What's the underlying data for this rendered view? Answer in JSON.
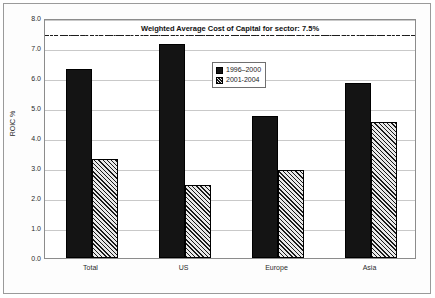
{
  "chart_data": {
    "type": "bar",
    "title": "",
    "annotation": "Weighted Average Cost of Capital for sector: 7.5%",
    "annotation_value": 7.5,
    "xlabel": "",
    "ylabel": "ROIC %",
    "categories": [
      "Total",
      "US",
      "Europe",
      "Asia"
    ],
    "series": [
      {
        "name": "1996–2000",
        "values": [
          6.3,
          7.15,
          4.75,
          5.85
        ]
      },
      {
        "name": "2001-2004",
        "values": [
          3.3,
          2.45,
          2.95,
          4.55
        ]
      }
    ],
    "ylim": [
      0.0,
      8.0
    ],
    "ytick_labels": [
      "0.0",
      "1.0",
      "2.0",
      "3.0",
      "4.0",
      "5.0",
      "6.0",
      "7.0",
      "8.0"
    ],
    "ytick_values": [
      0.0,
      1.0,
      2.0,
      3.0,
      4.0,
      5.0,
      6.0,
      7.0,
      8.0
    ],
    "grid": true,
    "legend_position": "upper center",
    "colors": {
      "series0": "#141414",
      "series1": "#e8e8e8",
      "gridline": "#c9c9c9",
      "axis": "#8c8c8c",
      "reference_line": "#1c1c1c",
      "text": "#2b2b2b"
    }
  }
}
